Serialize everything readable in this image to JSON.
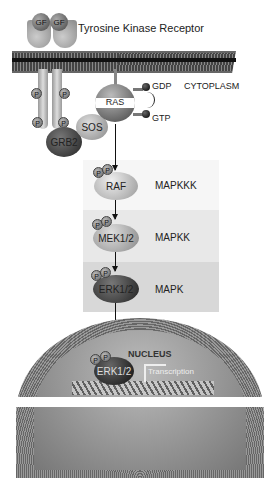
{
  "title": "Tyrosine Kinase Receptor",
  "receptor": {
    "ligands": [
      "GF",
      "GF"
    ],
    "phospho_label": "P"
  },
  "compartments": {
    "cytoplasm": "CYTOPLASM",
    "nucleus": "NUCLEUS"
  },
  "adaptors": {
    "grb2": "GRB2",
    "sos": "SOS"
  },
  "ras": {
    "label": "RAS",
    "gdp": "GDP",
    "gtp": "GTP"
  },
  "cascade": [
    {
      "protein": "RAF",
      "tier": "MAPKKK"
    },
    {
      "protein": "MEK1/2",
      "tier": "MAPKK"
    },
    {
      "protein": "ERK1/2",
      "tier": "MAPK"
    }
  ],
  "nucleus": {
    "protein": "ERK1/2",
    "transcription": "Transcription"
  },
  "colors": {
    "band_mapkkk": "#f4f4f4",
    "band_mapkk": "#e6e6e6",
    "band_mapk": "#d6d6d6",
    "membrane": "#3a3a3a",
    "nucleus_shell": "#8a8a8a"
  }
}
